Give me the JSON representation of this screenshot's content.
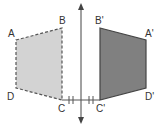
{
  "diagram": {
    "type": "reflection",
    "colors": {
      "original_fill": "#d3d3d3",
      "image_fill": "#808080",
      "outline": "#555555",
      "axis": "#444444"
    },
    "original_shape": {
      "labels": {
        "A": "A",
        "B": "B",
        "C": "C",
        "D": "D"
      }
    },
    "image_shape": {
      "labels": {
        "A": "A'",
        "B": "B'",
        "C": "C'",
        "D": "D'"
      }
    },
    "mirror_line": "vertical-axis",
    "equal_distance_ticks": 2
  }
}
